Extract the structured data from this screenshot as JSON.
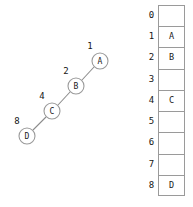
{
  "canvas": {
    "width": 193,
    "height": 207,
    "background": "#ffffff"
  },
  "colors": {
    "stroke": "#9a9a9a",
    "edge": "#8c8c8c",
    "text": "#1a1a1a",
    "cell_fill": "#ffffff"
  },
  "chain_diagram": {
    "title": "",
    "node_radius": 8,
    "nodes": [
      {
        "id": "A",
        "label": "A",
        "index_label": "1",
        "cx": 100,
        "cy": 61,
        "lx": 90,
        "ly": 46
      },
      {
        "id": "B",
        "label": "B",
        "index_label": "2",
        "cx": 76,
        "cy": 86,
        "lx": 66,
        "ly": 71
      },
      {
        "id": "C",
        "label": "C",
        "index_label": "4",
        "cx": 52,
        "cy": 111,
        "lx": 42,
        "ly": 96
      },
      {
        "id": "D",
        "label": "D",
        "index_label": "8",
        "cx": 27,
        "cy": 136,
        "lx": 17,
        "ly": 121
      }
    ],
    "edges": [
      {
        "from": "B",
        "to": "A",
        "x1": 82,
        "y1": 80,
        "x2": 94,
        "y2": 67
      },
      {
        "from": "C",
        "to": "B",
        "x1": 58,
        "y1": 105,
        "x2": 70,
        "y2": 92
      },
      {
        "from": "D",
        "to": "C",
        "x1": 33,
        "y1": 130,
        "x2": 46,
        "y2": 117
      }
    ]
  },
  "slot_table": {
    "row_count": 9,
    "rows": [
      {
        "index": "0",
        "value": ""
      },
      {
        "index": "1",
        "value": "A"
      },
      {
        "index": "2",
        "value": "B"
      },
      {
        "index": "3",
        "value": ""
      },
      {
        "index": "4",
        "value": "C"
      },
      {
        "index": "5",
        "value": ""
      },
      {
        "index": "6",
        "value": ""
      },
      {
        "index": "7",
        "value": ""
      },
      {
        "index": "8",
        "value": "D"
      }
    ]
  }
}
